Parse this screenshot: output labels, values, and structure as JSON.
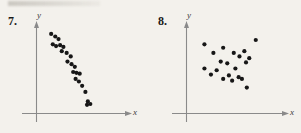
{
  "page": {
    "background_color": "#f3f1ec",
    "dot_color": "#171717",
    "axis_color": "#8a8a8a",
    "width": 301,
    "height": 133
  },
  "panels": [
    {
      "number_label": "7.",
      "x_axis_label": "x",
      "y_axis_label": "y"
    },
    {
      "number_label": "8.",
      "x_axis_label": "x",
      "y_axis_label": "y"
    }
  ],
  "chart_data": [
    {
      "type": "scatter",
      "title": "7.",
      "xlabel": "x",
      "ylabel": "y",
      "grid": false,
      "legend": null,
      "axis_ticks": false,
      "xlim": [
        0,
        100
      ],
      "ylim": [
        0,
        100
      ],
      "relationship": "negative linear correlation",
      "n_points": 22,
      "points": [
        {
          "x": 18,
          "y": 92
        },
        {
          "x": 23,
          "y": 89
        },
        {
          "x": 27,
          "y": 86
        },
        {
          "x": 20,
          "y": 80
        },
        {
          "x": 24,
          "y": 78
        },
        {
          "x": 29,
          "y": 79
        },
        {
          "x": 33,
          "y": 77
        },
        {
          "x": 31,
          "y": 72
        },
        {
          "x": 37,
          "y": 70
        },
        {
          "x": 42,
          "y": 66
        },
        {
          "x": 38,
          "y": 60
        },
        {
          "x": 43,
          "y": 57
        },
        {
          "x": 47,
          "y": 54
        },
        {
          "x": 45,
          "y": 48
        },
        {
          "x": 49,
          "y": 47
        },
        {
          "x": 53,
          "y": 46
        },
        {
          "x": 48,
          "y": 40
        },
        {
          "x": 52,
          "y": 37
        },
        {
          "x": 56,
          "y": 32
        },
        {
          "x": 60,
          "y": 25
        },
        {
          "x": 63,
          "y": 14
        },
        {
          "x": 66,
          "y": 11
        },
        {
          "x": 62,
          "y": 10
        }
      ]
    },
    {
      "type": "scatter",
      "title": "8.",
      "xlabel": "x",
      "ylabel": "y",
      "grid": false,
      "legend": null,
      "axis_ticks": false,
      "xlim": [
        0,
        100
      ],
      "ylim": [
        0,
        100
      ],
      "relationship": "no correlation / scattered",
      "n_points": 21,
      "points": [
        {
          "x": 22,
          "y": 80
        },
        {
          "x": 85,
          "y": 85
        },
        {
          "x": 45,
          "y": 76
        },
        {
          "x": 33,
          "y": 70
        },
        {
          "x": 58,
          "y": 70
        },
        {
          "x": 71,
          "y": 72
        },
        {
          "x": 65,
          "y": 66
        },
        {
          "x": 77,
          "y": 64
        },
        {
          "x": 42,
          "y": 60
        },
        {
          "x": 50,
          "y": 58
        },
        {
          "x": 73,
          "y": 59
        },
        {
          "x": 22,
          "y": 52
        },
        {
          "x": 37,
          "y": 50
        },
        {
          "x": 60,
          "y": 52
        },
        {
          "x": 30,
          "y": 45
        },
        {
          "x": 52,
          "y": 44
        },
        {
          "x": 45,
          "y": 40
        },
        {
          "x": 56,
          "y": 38
        },
        {
          "x": 64,
          "y": 42
        },
        {
          "x": 68,
          "y": 40
        },
        {
          "x": 74,
          "y": 30
        }
      ]
    }
  ]
}
